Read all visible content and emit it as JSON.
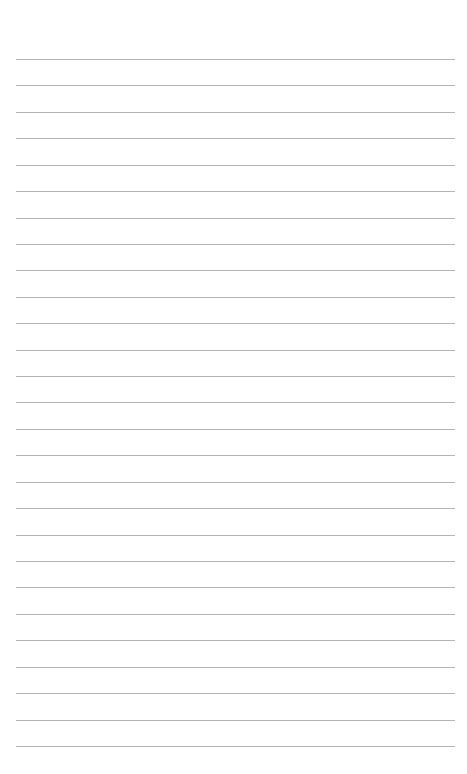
{
  "page": {
    "type": "lined-paper",
    "background_color": "#ffffff",
    "line_color": "#b4b4b4",
    "line_count": 27,
    "first_line_y": 59,
    "line_spacing": 26.42,
    "line_left": 16,
    "line_right": 455
  }
}
